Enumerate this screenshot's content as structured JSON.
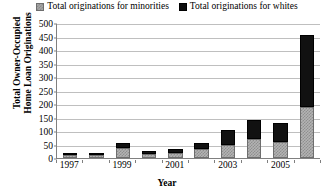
{
  "legend": {
    "position": "top-center",
    "entries": [
      {
        "label": "Total originations for minorities",
        "color": "#a6a6a6",
        "swatch": "minorities-swatch"
      },
      {
        "label": "Total originations for whites",
        "color": "#0d0d0d",
        "swatch": "whites-swatch"
      }
    ]
  },
  "axes": {
    "ylabel_line1": "Total Owner-Occupied",
    "ylabel_line2": "Home Loan Originations",
    "xlabel": "Year",
    "yticks": [
      "500",
      "450",
      "400",
      "350",
      "300",
      "250",
      "200",
      "150",
      "100",
      "50",
      "0"
    ],
    "xticks": [
      "1997",
      "",
      "1999",
      "",
      "2001",
      "",
      "2003",
      "",
      "2005",
      ""
    ]
  },
  "chart_data": {
    "type": "bar",
    "subtype": "stacked-column",
    "title": "",
    "xlabel": "Year",
    "ylabel": "Total Owner-Occupied Home Loan Originations",
    "categories": [
      "1997",
      "1998",
      "1999",
      "2000",
      "2001",
      "2002",
      "2003",
      "2004",
      "2005",
      "2006"
    ],
    "series": [
      {
        "name": "Total originations for minorities",
        "color": "#a6a6a6",
        "values": [
          12,
          10,
          38,
          15,
          20,
          35,
          48,
          70,
          60,
          190
        ]
      },
      {
        "name": "Total originations for whites",
        "color": "#0d0d0d",
        "values": [
          8,
          8,
          17,
          12,
          13,
          22,
          57,
          70,
          70,
          267
        ]
      }
    ],
    "totals": [
      20,
      18,
      55,
      27,
      33,
      57,
      105,
      140,
      130,
      457
    ],
    "ylim": [
      0,
      500
    ],
    "ytick_step": 50,
    "grid": "horizontal",
    "legend_position": "top"
  }
}
